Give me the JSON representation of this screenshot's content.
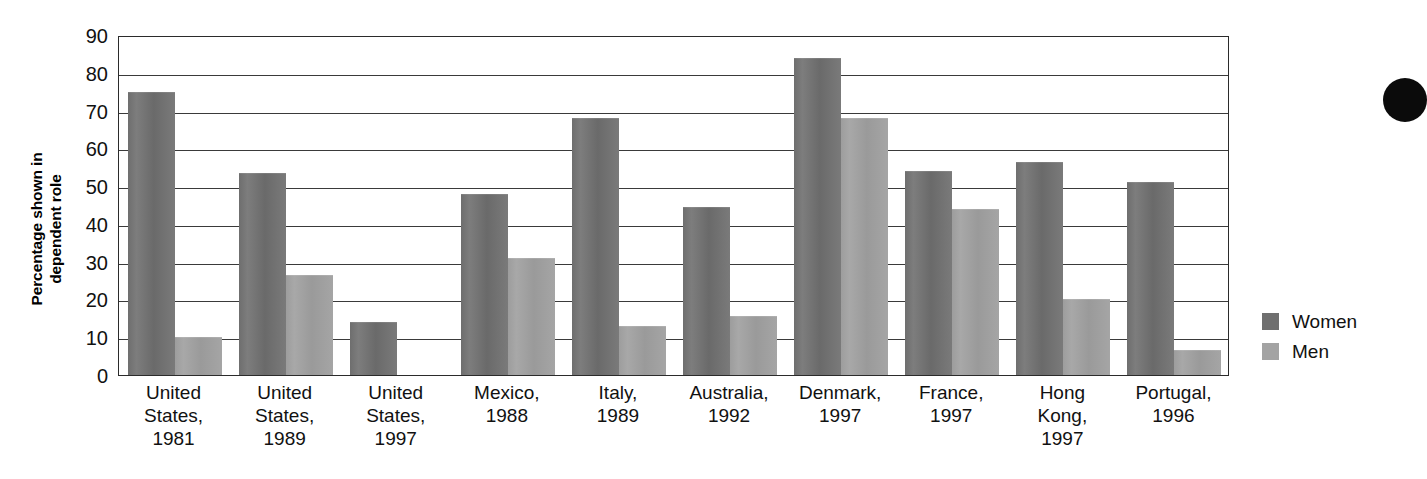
{
  "chart_data": {
    "type": "bar",
    "title": "",
    "xlabel": "",
    "ylabel": "Percentage shown\nin dependent role",
    "ylim": [
      0,
      90
    ],
    "ytick_step": 10,
    "yticks": [
      90,
      80,
      70,
      60,
      50,
      40,
      30,
      20,
      10,
      0
    ],
    "grid": true,
    "legend_position": "right",
    "categories": [
      "United\nStates,\n1981",
      "United\nStates,\n1989",
      "United\nStates,\n1997",
      "Mexico,\n1988",
      "Italy,\n1989",
      "Australia,\n1992",
      "Denmark,\n1997",
      "France,\n1997",
      "Hong\nKong,\n1997",
      "Portugal,\n1996"
    ],
    "series": [
      {
        "name": "Women",
        "color": "#6f6f6f",
        "values": [
          75,
          53.5,
          14,
          48,
          68,
          44.5,
          84,
          54,
          56.5,
          51
        ]
      },
      {
        "name": "Men",
        "color": "#a3a3a3",
        "values": [
          10,
          26.5,
          null,
          31,
          13,
          15.5,
          68,
          44,
          20,
          6.5
        ]
      }
    ]
  },
  "legend": {
    "items": [
      {
        "label": "Women",
        "swatch": "women"
      },
      {
        "label": "Men",
        "swatch": "men"
      }
    ]
  }
}
